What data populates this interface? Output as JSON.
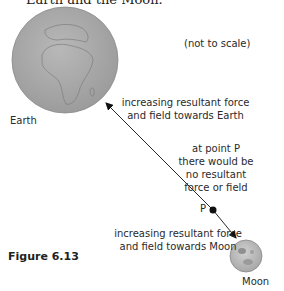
{
  "header": {
    "text": "Earth and the Moon."
  },
  "diagram": {
    "note": "(not to scale)",
    "bodies": [
      {
        "name": "Earth",
        "label": "Earth",
        "color": "#a9a9a9"
      },
      {
        "name": "Moon",
        "label": "Moon",
        "color": "#bdbdbd"
      }
    ],
    "labels": {
      "towards_earth_line1": "increasing resultant force",
      "towards_earth_line2": "and field towards Earth",
      "point_p_line1": "at point P",
      "point_p_line2": "there would be",
      "point_p_line3": "no resultant",
      "point_p_line4": "force or field",
      "point_p": "P",
      "towards_moon_line1": "increasing resultant force",
      "towards_moon_line2": "and field towards Moon"
    }
  },
  "caption": {
    "text": "Figure 6.13"
  }
}
